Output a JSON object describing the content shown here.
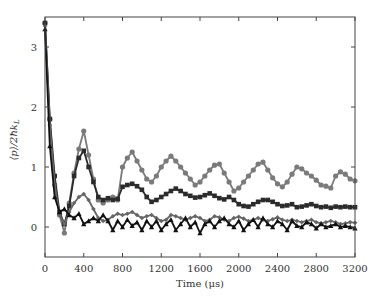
{
  "chart_data": {
    "type": "line",
    "title": "",
    "xlabel": "Time (μs)",
    "ylabel": "⟨p⟩/2ħk_L",
    "xlim": [
      0,
      3200
    ],
    "ylim": [
      -0.5,
      3.5
    ],
    "xticks": [
      0,
      400,
      800,
      1200,
      1600,
      2000,
      2400,
      2800,
      3200
    ],
    "yticks": [
      0,
      1,
      2,
      3
    ],
    "grid": false,
    "legend": "none",
    "series": [
      {
        "name": "series-gray-circles",
        "marker": "circle",
        "color": "#7a7a7a",
        "x": [
          0,
          50,
          100,
          150,
          200,
          250,
          300,
          350,
          400,
          450,
          500,
          550,
          600,
          650,
          700,
          750,
          800,
          850,
          900,
          950,
          1000,
          1050,
          1100,
          1150,
          1200,
          1250,
          1300,
          1350,
          1400,
          1450,
          1500,
          1550,
          1600,
          1650,
          1700,
          1750,
          1800,
          1850,
          1900,
          1950,
          2000,
          2050,
          2100,
          2150,
          2200,
          2250,
          2300,
          2350,
          2400,
          2450,
          2500,
          2550,
          2600,
          2650,
          2700,
          2750,
          2800,
          2850,
          2900,
          2950,
          3000,
          3050,
          3100,
          3150,
          3200
        ],
        "values": [
          3.4,
          1.8,
          0.7,
          0.2,
          -0.1,
          0.4,
          0.9,
          1.3,
          1.6,
          1.2,
          0.8,
          0.45,
          0.4,
          0.45,
          0.5,
          0.45,
          1.0,
          1.15,
          1.25,
          1.1,
          0.95,
          0.8,
          0.75,
          0.85,
          1.0,
          1.1,
          1.18,
          1.1,
          1.0,
          0.9,
          0.8,
          0.7,
          0.75,
          0.85,
          0.95,
          1.03,
          1.05,
          0.9,
          0.75,
          0.6,
          0.65,
          0.75,
          0.85,
          0.95,
          1.05,
          1.08,
          0.95,
          0.82,
          0.72,
          0.67,
          0.75,
          0.88,
          1.0,
          0.97,
          0.9,
          0.85,
          0.78,
          0.7,
          0.68,
          0.65,
          0.85,
          0.92,
          0.88,
          0.8,
          0.77
        ]
      },
      {
        "name": "series-black-squares",
        "marker": "square",
        "color": "#2b2b2b",
        "x": [
          0,
          50,
          100,
          150,
          200,
          250,
          300,
          350,
          400,
          450,
          500,
          550,
          600,
          650,
          700,
          750,
          800,
          850,
          900,
          950,
          1000,
          1050,
          1100,
          1150,
          1200,
          1250,
          1300,
          1350,
          1400,
          1450,
          1500,
          1550,
          1600,
          1650,
          1700,
          1750,
          1800,
          1850,
          1900,
          1950,
          2000,
          2050,
          2100,
          2150,
          2200,
          2250,
          2300,
          2350,
          2400,
          2450,
          2500,
          2550,
          2600,
          2650,
          2700,
          2750,
          2800,
          2850,
          2900,
          2950,
          3000,
          3050,
          3100,
          3150,
          3200
        ],
        "values": [
          3.4,
          1.8,
          0.85,
          0.25,
          0.05,
          0.35,
          0.85,
          1.15,
          1.27,
          1.0,
          0.75,
          0.5,
          0.45,
          0.48,
          0.45,
          0.47,
          0.67,
          0.7,
          0.72,
          0.68,
          0.62,
          0.5,
          0.42,
          0.45,
          0.5,
          0.55,
          0.6,
          0.64,
          0.6,
          0.55,
          0.52,
          0.49,
          0.5,
          0.53,
          0.56,
          0.52,
          0.48,
          0.46,
          0.5,
          0.45,
          0.38,
          0.35,
          0.34,
          0.38,
          0.42,
          0.45,
          0.45,
          0.42,
          0.38,
          0.35,
          0.36,
          0.38,
          0.33,
          0.34,
          0.36,
          0.38,
          0.35,
          0.33,
          0.34,
          0.32,
          0.34,
          0.33,
          0.34,
          0.33,
          0.33
        ]
      },
      {
        "name": "series-gray-diamonds",
        "marker": "diamond",
        "color": "#666666",
        "x": [
          0,
          50,
          100,
          150,
          200,
          250,
          300,
          350,
          400,
          450,
          500,
          550,
          600,
          650,
          700,
          750,
          800,
          850,
          900,
          950,
          1000,
          1050,
          1100,
          1150,
          1200,
          1250,
          1300,
          1350,
          1400,
          1450,
          1500,
          1550,
          1600,
          1650,
          1700,
          1750,
          1800,
          1850,
          1900,
          1950,
          2000,
          2050,
          2100,
          2150,
          2200,
          2250,
          2300,
          2350,
          2400,
          2450,
          2500,
          2550,
          2600,
          2650,
          2700,
          2750,
          2800,
          2850,
          2900,
          2950,
          3000,
          3050,
          3100,
          3150,
          3200
        ],
        "values": [
          3.35,
          1.7,
          0.7,
          0.2,
          0.05,
          0.25,
          0.4,
          0.5,
          0.55,
          0.45,
          0.3,
          0.15,
          0.1,
          0.12,
          0.18,
          0.22,
          0.2,
          0.22,
          0.25,
          0.2,
          0.15,
          0.18,
          0.2,
          0.15,
          0.1,
          0.12,
          0.2,
          0.18,
          0.15,
          0.12,
          0.15,
          0.18,
          0.15,
          0.1,
          0.12,
          0.18,
          0.16,
          0.12,
          0.1,
          0.15,
          0.17,
          0.14,
          0.1,
          0.12,
          0.15,
          0.12,
          0.1,
          0.13,
          0.16,
          0.12,
          0.1,
          0.12,
          0.1,
          0.08,
          0.1,
          0.12,
          0.08,
          0.06,
          0.08,
          0.1,
          0.08,
          0.05,
          0.06,
          0.08,
          0.07
        ]
      },
      {
        "name": "series-black-triangles",
        "marker": "triangle",
        "color": "#111111",
        "x": [
          0,
          50,
          100,
          150,
          200,
          250,
          300,
          350,
          400,
          450,
          500,
          550,
          600,
          650,
          700,
          750,
          800,
          850,
          900,
          950,
          1000,
          1050,
          1100,
          1150,
          1200,
          1250,
          1300,
          1350,
          1400,
          1450,
          1500,
          1550,
          1600,
          1650,
          1700,
          1750,
          1800,
          1850,
          1900,
          1950,
          2000,
          2050,
          2100,
          2150,
          2200,
          2250,
          2300,
          2350,
          2400,
          2450,
          2500,
          2550,
          2600,
          2650,
          2700,
          2750,
          2800,
          2850,
          2900,
          2950,
          3000,
          3050,
          3100,
          3150,
          3200
        ],
        "values": [
          3.3,
          1.35,
          0.5,
          0.25,
          0.3,
          0.2,
          0.15,
          0.22,
          0.05,
          0.1,
          0.15,
          0.1,
          0.2,
          0.1,
          -0.05,
          0.1,
          0.0,
          0.12,
          0.02,
          0.08,
          -0.05,
          0.1,
          0.0,
          0.1,
          -0.05,
          0.05,
          0.12,
          -0.05,
          0.05,
          0.15,
          0.0,
          0.08,
          -0.1,
          0.05,
          0.1,
          0.0,
          0.1,
          0.15,
          0.05,
          0.0,
          0.1,
          -0.05,
          0.05,
          0.12,
          0.0,
          0.15,
          0.05,
          0.0,
          0.1,
          0.05,
          -0.05,
          0.1,
          0.02,
          0.0,
          0.08,
          0.05,
          -0.02,
          0.05,
          0.0,
          0.02,
          0.05,
          0.0,
          0.02,
          0.0,
          -0.02
        ]
      }
    ]
  }
}
